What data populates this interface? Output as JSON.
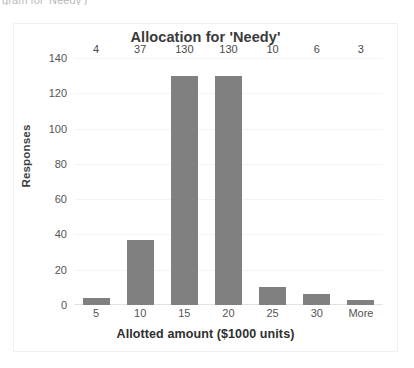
{
  "clipped_caption": "gram for 'Needy')",
  "chart_data": {
    "type": "bar",
    "title": "Allocation for 'Needy'",
    "xlabel": "Allotted amount ($1000 units)",
    "ylabel": "Responses",
    "categories": [
      "5",
      "10",
      "15",
      "20",
      "25",
      "30",
      "More"
    ],
    "values": [
      4,
      37,
      130,
      130,
      10,
      6,
      3
    ],
    "data_labels": [
      "4",
      "37",
      "130",
      "130",
      "10",
      "6",
      "3"
    ],
    "ylim": [
      0,
      140
    ],
    "yticks": [
      0,
      20,
      40,
      60,
      80,
      100,
      120,
      140
    ],
    "ytick_labels": [
      "0",
      "20",
      "40",
      "60",
      "80",
      "100",
      "120",
      "140"
    ],
    "grid": true,
    "legend": false,
    "bar_color": "#808080",
    "title_color": "#3a3a3a",
    "axis_text_color": "#555555",
    "plot_background": "#ffffff",
    "frame_border_color": "#f0f0f0"
  }
}
